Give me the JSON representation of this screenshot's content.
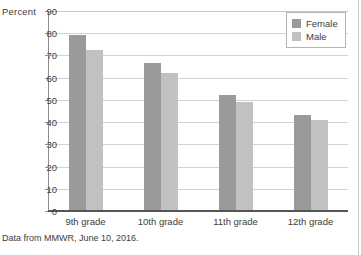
{
  "chart_data": {
    "type": "bar",
    "title": "",
    "xlabel": "",
    "ylabel": "Percent",
    "ylim": [
      0,
      90
    ],
    "ytick_step": 10,
    "yticks": [
      90,
      80,
      70,
      60,
      50,
      40,
      30,
      20,
      10,
      0
    ],
    "grid": true,
    "legend_position": "top-right",
    "categories": [
      "9th grade",
      "10th grade",
      "11th grade",
      "12th grade"
    ],
    "series": [
      {
        "name": "Female",
        "color": "#9a9a9a",
        "values": [
          79,
          66.5,
          52,
          43
        ]
      },
      {
        "name": "Male",
        "color": "#c1c1c1",
        "values": [
          72.5,
          62,
          49,
          41
        ]
      }
    ],
    "source_note": "Data from MMWR, June 10, 2016."
  }
}
